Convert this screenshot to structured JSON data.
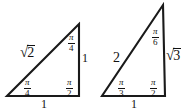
{
  "figure": {
    "background_color": "#ffffff",
    "line_color": "#1a1a1a",
    "text_color": "#111111"
  },
  "triangles": [
    {
      "name": "isosceles-right-triangle",
      "description": "45-45-90 right triangle",
      "vertices": {
        "bottom_left": [
          7,
          96
        ],
        "bottom_right": [
          79,
          96
        ],
        "top": [
          79,
          24
        ]
      },
      "sides": {
        "base": "1",
        "vertical": "1",
        "hypotenuse_sign": "√",
        "hypotenuse_radicand": "2"
      },
      "angles": {
        "top": {
          "numerator": "π",
          "denominator": "4"
        },
        "bottom_left": {
          "numerator": "π",
          "denominator": "4"
        },
        "bottom_right": {
          "numerator": "π",
          "denominator": "2"
        }
      }
    },
    {
      "name": "thirty-sixty-ninety-triangle",
      "description": "30-60-90 right triangle",
      "vertices": {
        "bottom_left": [
          102,
          96
        ],
        "bottom_right": [
          165,
          96
        ],
        "top": [
          163,
          5
        ]
      },
      "sides": {
        "base": "1",
        "vertical_sign": "√",
        "vertical_radicand": "3",
        "hypotenuse": "2"
      },
      "angles": {
        "top": {
          "numerator": "π",
          "denominator": "6"
        },
        "bottom_left": {
          "numerator": "π",
          "denominator": "3"
        },
        "bottom_right": {
          "numerator": "π",
          "denominator": "2"
        }
      }
    }
  ]
}
